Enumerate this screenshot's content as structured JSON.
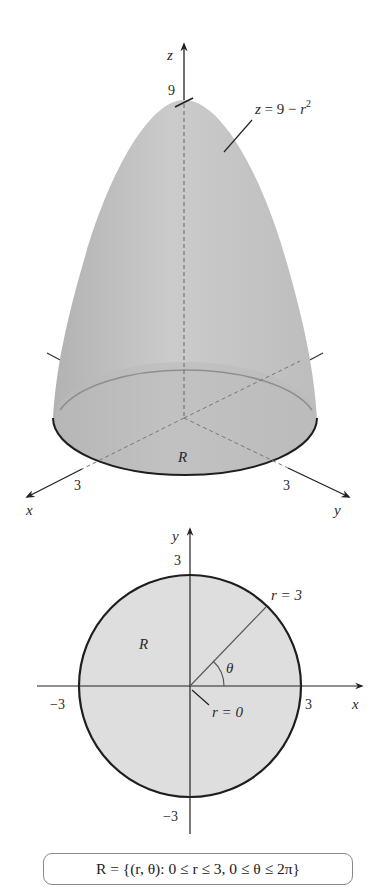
{
  "surface_plot": {
    "z_axis_label": "z",
    "x_axis_label": "x",
    "y_axis_label": "y",
    "z_tick": "9",
    "x_tick": "3",
    "y_tick": "3",
    "surface_equation": "z = 9 − r²",
    "surface_eq_lhs": "z",
    "surface_eq_mid": " = 9 − ",
    "surface_eq_r": "r",
    "surface_eq_exp": "2",
    "region_label": "R"
  },
  "region_plot": {
    "x_axis_label": "x",
    "y_axis_label": "y",
    "x_tick_pos": "3",
    "x_tick_neg": "−3",
    "y_tick_pos": "3",
    "y_tick_neg": "−3",
    "region_label": "R",
    "outer_radius_label": "r = 3",
    "inner_radius_label": "r = 0",
    "angle_label": "θ"
  },
  "caption": {
    "text": "R = {(r, θ): 0 ≤ r ≤ 3, 0 ≤ θ ≤ 2π}"
  },
  "colors": {
    "surface_fill": "#c4c4c4",
    "region_fill": "#dedede",
    "ink": "#222222"
  }
}
